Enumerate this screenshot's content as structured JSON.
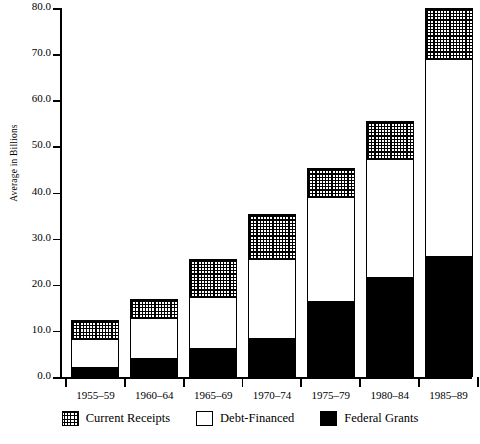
{
  "chart_data": {
    "type": "bar",
    "subtype": "stacked-bar",
    "title": "",
    "xlabel": "",
    "ylabel": "Average in Billions",
    "ylim": [
      0.0,
      80.0
    ],
    "ytick_step": 10.0,
    "ytick_labels": [
      "0.0",
      "10.0",
      "20.0",
      "30.0",
      "40.0",
      "50.0",
      "60.0",
      "70.0",
      "80.0"
    ],
    "ytick_values": [
      0.0,
      10.0,
      20.0,
      30.0,
      40.0,
      50.0,
      60.0,
      70.0,
      80.0
    ],
    "grid": false,
    "legend_position": "bottom",
    "categories": [
      "1955–59",
      "1960–64",
      "1965–69",
      "1970–74",
      "1975–79",
      "1980–84",
      "1985–89"
    ],
    "series": [
      {
        "name": "Federal Grants",
        "swatch": "black",
        "color": "#000000",
        "values": [
          2.0,
          4.0,
          6.0,
          8.2,
          16.2,
          21.4,
          26.0
        ]
      },
      {
        "name": "Debt-Financed",
        "swatch": "white",
        "color": "#ffffff",
        "values": [
          6.2,
          8.7,
          11.3,
          17.4,
          22.8,
          25.9,
          43.0
        ]
      },
      {
        "name": "Current Receipts",
        "swatch": "dotted",
        "color": "#dddddd",
        "values": [
          4.2,
          4.2,
          8.2,
          9.8,
          6.3,
          8.1,
          11.0
        ]
      }
    ],
    "totals": [
      12.4,
      16.9,
      25.5,
      35.4,
      45.3,
      55.4,
      80.0
    ],
    "cumulative_tops": [
      {
        "grants": 2.0,
        "debt": 8.2,
        "receipts": 12.4
      },
      {
        "grants": 4.0,
        "debt": 12.7,
        "receipts": 16.9
      },
      {
        "grants": 6.0,
        "debt": 17.3,
        "receipts": 25.5
      },
      {
        "grants": 8.2,
        "debt": 25.6,
        "receipts": 35.4
      },
      {
        "grants": 16.2,
        "debt": 39.0,
        "receipts": 45.3
      },
      {
        "grants": 21.4,
        "debt": 47.3,
        "receipts": 55.4
      },
      {
        "grants": 26.0,
        "debt": 69.0,
        "receipts": 80.0
      }
    ]
  },
  "axis": {
    "y_title": "Average in Billions"
  },
  "legend": {
    "items": [
      {
        "label": "Current Receipts",
        "swatch": "dotted"
      },
      {
        "label": "Debt-Financed",
        "swatch": "white"
      },
      {
        "label": "Federal Grants",
        "swatch": "black"
      }
    ]
  }
}
